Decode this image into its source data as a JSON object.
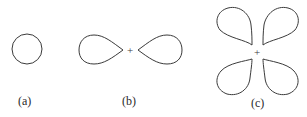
{
  "diagram": {
    "panels": [
      {
        "id": "a",
        "label": "(a)",
        "shape": "circle",
        "lobes": 1
      },
      {
        "id": "b",
        "label": "(b)",
        "shape": "two-lobe (dumbbell)",
        "lobes": 2,
        "nucleus_marker": "+"
      },
      {
        "id": "c",
        "label": "(c)",
        "shape": "four-lobe (cloverleaf)",
        "lobes": 4,
        "nucleus_marker": "+"
      }
    ],
    "colors": {
      "background": "#ffffff",
      "line": "#3a3a3a",
      "text": "#2a2a2a"
    }
  }
}
